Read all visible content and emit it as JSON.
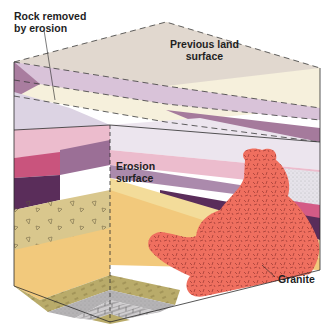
{
  "diagram": {
    "labels": {
      "rock_removed": [
        "Rock removed",
        "by erosion"
      ],
      "previous_land": [
        "Previous land",
        "surface"
      ],
      "erosion_surface": [
        "Erosion",
        "surface"
      ],
      "granite": "Granite"
    },
    "colors": {
      "removed_top": "#d8cfca",
      "cream": "#f6f0dc",
      "lavender": "#d6c3d8",
      "mauve": "#a57a9c",
      "pale": "#e9e3ea",
      "pink": "#ecbccd",
      "deep_purple": "#7a4f79",
      "magenta": "#c9547d",
      "dark_plum": "#5a2d5a",
      "sand": "#f3dc9a",
      "conglomerate": "#d9c78d",
      "sandstone": "#f2c97c",
      "olive": "#b9ab6a",
      "gray": "#b5b3b5",
      "brick": "#c9c7c9",
      "granite": "#ef6f5f"
    }
  }
}
